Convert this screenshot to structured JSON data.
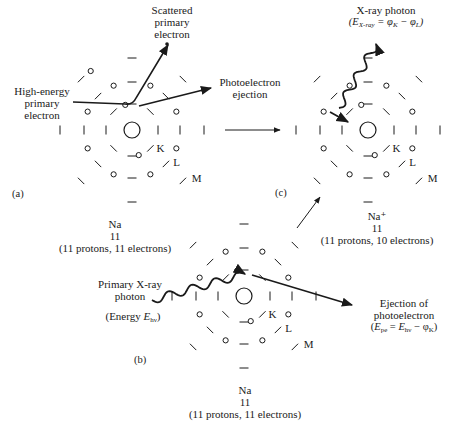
{
  "panels": {
    "a": {
      "tag": "(a)",
      "incoming_label": [
        "High-energy",
        "primary",
        "electron"
      ],
      "scattered_label": [
        "Scattered",
        "primary",
        "electron"
      ],
      "ejection_label": [
        "Photoelectron",
        "ejection"
      ],
      "element": "Na",
      "atomic_number": "11",
      "composition": "(11 protons, 11 electrons)"
    },
    "b": {
      "tag": "(b)",
      "incoming_label": [
        "Primary X-ray",
        "photon"
      ],
      "energy_label_prefix": "(Energy ",
      "energy_symbol": "E",
      "energy_sub": "hν",
      "energy_label_suffix": ")",
      "ejection_label": [
        "Ejection of",
        "photoelectron"
      ],
      "ejection_formula": "(Epe = Ehν − φK)",
      "element": "Na",
      "atomic_number": "11",
      "composition": "(11 protons, 11 electrons)"
    },
    "c": {
      "tag": "(c)",
      "photon_label": "X-ray photon",
      "photon_formula": "(EX-ray = φK − φL)",
      "element": "Na⁺",
      "atomic_number": "11",
      "composition": "(11 protons, 10 electrons)"
    }
  },
  "shell_labels": [
    "K",
    "L",
    "M"
  ],
  "colors": {
    "ink": "#1a1a1a",
    "background": "#ffffff"
  }
}
